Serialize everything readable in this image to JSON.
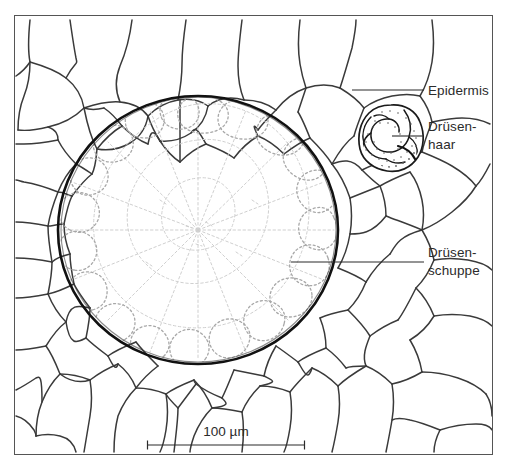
{
  "figure": {
    "kind": "botanical-micrograph-line-drawing",
    "background_color": "#ffffff",
    "ink_color": "#1a1a1a",
    "faint_ink_color": "#b9b9b9",
    "frame": {
      "x": 14,
      "y": 15,
      "width": 479,
      "height": 440,
      "stroke_color": "#555555",
      "stroke_width": 1
    },
    "labels": [
      {
        "id": "epidermis",
        "text": "Epidermis",
        "lines": [
          "Epidermis"
        ],
        "text_x": 428,
        "text_y": 82,
        "leader": {
          "x1": 352,
          "y1": 90,
          "x2": 424,
          "y2": 90
        }
      },
      {
        "id": "druesenhaar",
        "text": "Drüsen-\nhaar",
        "lines": [
          "Drüsen-",
          "haar"
        ],
        "text_x": 428,
        "text_y": 118,
        "leader": {
          "x1": 392,
          "y1": 136,
          "x2": 424,
          "y2": 136
        }
      },
      {
        "id": "druesenschuppe",
        "text": "Drüsen-\nschuppe",
        "lines": [
          "Drüsen-",
          "schuppe"
        ],
        "text_x": 428,
        "text_y": 244,
        "leader": {
          "x1": 291,
          "y1": 262,
          "x2": 424,
          "y2": 262
        }
      }
    ],
    "scale_bar": {
      "label": "100 µm",
      "value": 100,
      "unit": "µm",
      "x1": 147,
      "x2": 305,
      "y": 445,
      "tick_height": 9,
      "stroke_color": "#2b2b2b"
    },
    "gland_scale": {
      "center_x": 198,
      "center_y": 230,
      "radius_x": 140,
      "radius_y": 134,
      "outline_color": "#111111",
      "outline_width": 2.6,
      "interior_color": "#ffffff",
      "interior_detail_color": "#cfcfcf",
      "radial_cell_count": 16
    },
    "gland_hair": {
      "center_x": 392,
      "center_y": 137,
      "radius_x": 31,
      "radius_y": 32,
      "outline_color": "#1a1a1a",
      "stipple_color": "#6e6e6e"
    },
    "epidermis": {
      "cell_wall_color": "#3a3a3a",
      "cell_wall_width": 1.5,
      "description": "unregelmaessige polygonale Epidermiszellen"
    }
  }
}
